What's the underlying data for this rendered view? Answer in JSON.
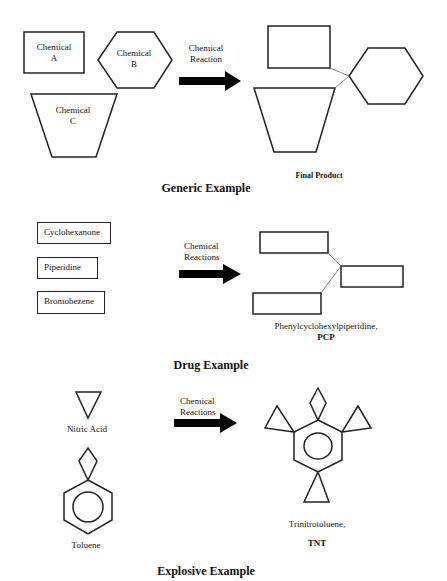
{
  "colors": {
    "stroke": "#222222",
    "background": "#ffffff",
    "arrow": "#000000"
  },
  "generic": {
    "title": "Generic Example",
    "chemical_a": {
      "line1": "Chemical",
      "line2": "A"
    },
    "chemical_b": {
      "line1": "Chemical",
      "line2": "B"
    },
    "chemical_c": {
      "line1": "Chemical",
      "line2": "C"
    },
    "arrow_label": {
      "line1": "Chemical",
      "line2": "Reaction"
    },
    "product_label": "Final Product"
  },
  "drug": {
    "title": "Drug Example",
    "reagents": [
      "Cyclohexanone",
      "Piperidine",
      "Bromobezene"
    ],
    "arrow_label": {
      "line1": "Chemical",
      "line2": "Reactions"
    },
    "product_name": "Phenylcyclohexylpiperidine,",
    "product_abbrev": "PCP"
  },
  "explosive": {
    "title": "Explosive Example",
    "reagent_1": "Nitric Acid",
    "reagent_2": "Toluene",
    "arrow_label": {
      "line1": "Chemical",
      "line2": "Reactions"
    },
    "product_name": "Trinitrotoluene,",
    "product_abbrev": "TNT"
  }
}
